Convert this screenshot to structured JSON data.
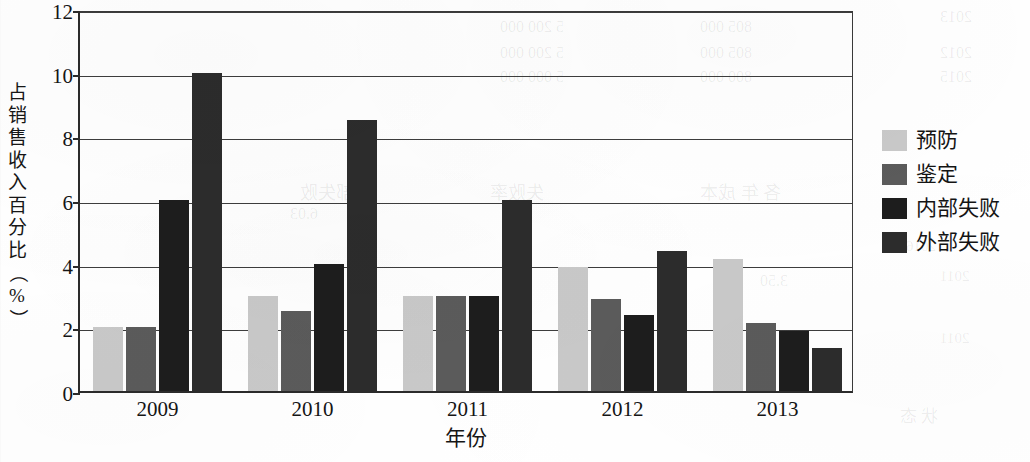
{
  "chart_data": {
    "type": "bar",
    "title": "",
    "xlabel": "年份",
    "ylabel": "占销售收入百分比（%）",
    "ylabel_chars": [
      "占",
      "销",
      "售",
      "收",
      "入",
      "百",
      "分",
      "比",
      "（",
      "%",
      "）"
    ],
    "categories": [
      "2009",
      "2010",
      "2011",
      "2012",
      "2013"
    ],
    "series": [
      {
        "name": "预防",
        "color": "#c9c9c9",
        "values": [
          2.0,
          3.0,
          3.0,
          3.9,
          4.15
        ]
      },
      {
        "name": "鉴定",
        "color": "#5b5b5b",
        "values": [
          2.0,
          2.5,
          3.0,
          2.9,
          2.15
        ]
      },
      {
        "name": "内部失败",
        "color": "#1d1d1d",
        "values": [
          6.0,
          4.0,
          3.0,
          2.4,
          1.9
        ]
      },
      {
        "name": "外部失败",
        "color": "#2c2c2c",
        "values": [
          10.0,
          8.5,
          6.0,
          4.4,
          1.35
        ]
      }
    ],
    "ylim": [
      0,
      12
    ],
    "yticks": [
      0,
      2,
      4,
      6,
      8,
      10,
      12
    ],
    "ytick_labels": [
      "0",
      "2",
      "4",
      "6",
      "8",
      "10",
      "12"
    ],
    "grid": true,
    "legend_position": "right",
    "axis_color": "#2b2b2b",
    "background": "#ffffff"
  },
  "ghost_text": [
    {
      "text": "2013",
      "x": 940,
      "y": 8,
      "size": 16
    },
    {
      "text": "2012",
      "x": 940,
      "y": 44,
      "size": 16
    },
    {
      "text": "2015",
      "x": 940,
      "y": 68,
      "size": 16
    },
    {
      "text": "2016",
      "x": 906,
      "y": 238,
      "size": 15
    },
    {
      "text": "2011",
      "x": 940,
      "y": 268,
      "size": 15
    },
    {
      "text": "2011",
      "x": 940,
      "y": 330,
      "size": 15
    },
    {
      "text": "5 200 000",
      "x": 500,
      "y": 18,
      "size": 16
    },
    {
      "text": "5 200 000",
      "x": 500,
      "y": 44,
      "size": 16
    },
    {
      "text": "5 000 000",
      "x": 500,
      "y": 68,
      "size": 16
    },
    {
      "text": "805 000",
      "x": 700,
      "y": 18,
      "size": 16
    },
    {
      "text": "805 000",
      "x": 700,
      "y": 44,
      "size": 16
    },
    {
      "text": "800 000",
      "x": 700,
      "y": 68,
      "size": 16
    },
    {
      "text": "内部失败",
      "x": 300,
      "y": 178,
      "size": 18
    },
    {
      "text": "失败率",
      "x": 490,
      "y": 178,
      "size": 18
    },
    {
      "text": "各 年 成本",
      "x": 700,
      "y": 178,
      "size": 18
    },
    {
      "text": "6.03",
      "x": 290,
      "y": 205,
      "size": 16
    },
    {
      "text": "3.50",
      "x": 760,
      "y": 272,
      "size": 16
    },
    {
      "text": "状 态",
      "x": 900,
      "y": 402,
      "size": 17
    }
  ]
}
